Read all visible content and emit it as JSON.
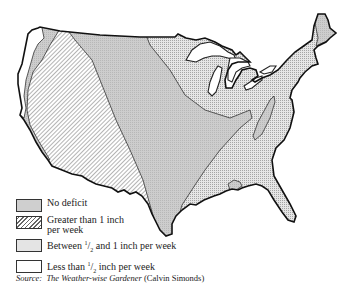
{
  "map": {
    "subject": "Weekly water deficit, contiguous United States",
    "regions": [
      {
        "name": "west-coast-strip",
        "category": "less_than_half"
      },
      {
        "name": "pacific-northwest-band",
        "category": "no_deficit"
      },
      {
        "name": "west",
        "category": "greater_than_1"
      },
      {
        "name": "great-plains-band",
        "category": "no_deficit"
      },
      {
        "name": "east",
        "category": "between_half_and_1"
      },
      {
        "name": "maine",
        "category": "no_deficit"
      },
      {
        "name": "appalachians",
        "category": "no_deficit"
      },
      {
        "name": "gulf-coast-patch",
        "category": "no_deficit"
      }
    ]
  },
  "legend": {
    "items": [
      {
        "key": "no_deficit",
        "label": "No deficit",
        "pattern": "solid-gray",
        "color": "#cfcfcf"
      },
      {
        "key": "greater_than_1",
        "label_line1": "Greater than 1 inch",
        "label_line2": "per week",
        "pattern": "diagonal-hatch"
      },
      {
        "key": "between_half_and_1",
        "label_pre": "Between ",
        "frac_num": "1",
        "frac_den": "2",
        "label_post": " and 1 inch per week",
        "pattern": "stipple"
      },
      {
        "key": "less_than_half",
        "label_pre": "Less than ",
        "frac_num": "1",
        "frac_den": "2",
        "label_post": " inch per week",
        "pattern": "white"
      }
    ]
  },
  "source": {
    "prefix": "Source:",
    "title": "The Weather-wise Gardener",
    "author": "(Calvin Simonds)"
  }
}
